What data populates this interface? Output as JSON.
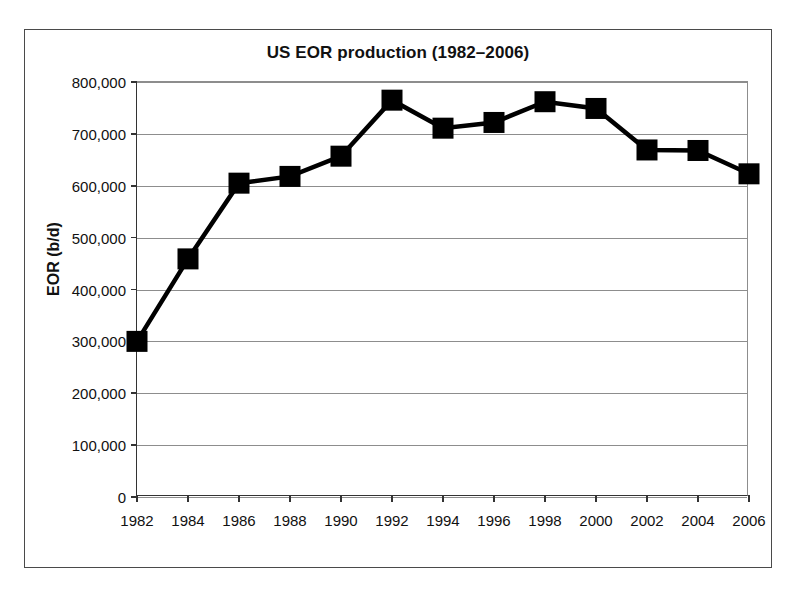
{
  "chart_data": {
    "type": "line",
    "title": "US EOR production (1982–2006)",
    "xlabel": "",
    "ylabel": "EOR (b/d)",
    "categories": [
      1982,
      1984,
      1986,
      1988,
      1990,
      1992,
      1994,
      1996,
      1998,
      2000,
      2002,
      2004,
      2006
    ],
    "x_tick_labels": [
      "1982",
      "1984",
      "1986",
      "1988",
      "1990",
      "1992",
      "1994",
      "1996",
      "1998",
      "2000",
      "2002",
      "2004",
      "2006"
    ],
    "values": [
      300000,
      459000,
      605000,
      618000,
      657000,
      765000,
      711000,
      722000,
      762000,
      749000,
      669000,
      668000,
      623000
    ],
    "y_tick_labels": [
      "800,000",
      "700,000",
      "600,000",
      "500,000",
      "400,000",
      "300,000",
      "200,000",
      "100,000",
      "0"
    ],
    "y_tick_values": [
      800000,
      700000,
      600000,
      500000,
      400000,
      300000,
      200000,
      100000,
      0
    ],
    "ylim": [
      0,
      800000
    ],
    "xlim": [
      1982,
      2006
    ],
    "grid": "horizontal",
    "legend": "none",
    "series": [
      {
        "name": "US EOR production",
        "marker": "square",
        "marker_color": "#000000",
        "line_color": "#000000",
        "values": [
          300000,
          459000,
          605000,
          618000,
          657000,
          765000,
          711000,
          722000,
          762000,
          749000,
          669000,
          668000,
          623000
        ]
      }
    ],
    "colors": {
      "line": "#000000",
      "marker": "#000000",
      "grid": "#8d8d8d",
      "axis": "#333333",
      "frame": "#4a4a4a",
      "background": "#ffffff",
      "text": "#111111"
    }
  }
}
